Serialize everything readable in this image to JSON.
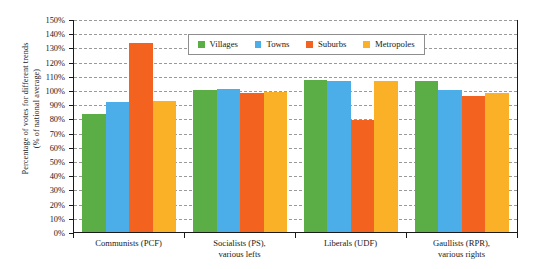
{
  "chart_data": {
    "type": "bar",
    "title": "",
    "xlabel": "",
    "ylabel_lines": [
      "Percentage of votes for different trends",
      "(% of national average)"
    ],
    "ylim": [
      0,
      150
    ],
    "ytick_step": 10,
    "ytick_labels": [
      "0%",
      "10%",
      "20%",
      "30%",
      "40%",
      "50%",
      "60%",
      "70%",
      "80%",
      "90%",
      "100%",
      "110%",
      "120%",
      "130%",
      "140%",
      "150%"
    ],
    "ytick_values": [
      0,
      10,
      20,
      30,
      40,
      50,
      60,
      70,
      80,
      90,
      100,
      110,
      120,
      130,
      140,
      150
    ],
    "grid": true,
    "grid_style": "dashed-horizontal",
    "legend_position": "top-center-inside",
    "categories": [
      {
        "lines": [
          "Communists (PCF)"
        ]
      },
      {
        "lines": [
          "Socialists (PS),",
          "various lefts"
        ]
      },
      {
        "lines": [
          "Liberals (UDF)"
        ]
      },
      {
        "lines": [
          "Gaullists (RPR),",
          "various rights"
        ]
      }
    ],
    "category_labels": [
      "Communists (PCF)",
      "Socialists (PS), various lefts",
      "Liberals (UDF)",
      "Gaullists (RPR), various rights"
    ],
    "series": [
      {
        "name": "Villages",
        "color": "#5BAD46",
        "values": [
          83,
          100,
          107,
          106
        ]
      },
      {
        "name": "Towns",
        "color": "#4BAEE8",
        "values": [
          91.5,
          101,
          106,
          100
        ]
      },
      {
        "name": "Suburbs",
        "color": "#F4621F",
        "values": [
          133,
          98,
          79,
          96
        ]
      },
      {
        "name": "Metropoles",
        "color": "#FAB127",
        "values": [
          92.5,
          98.5,
          106,
          98
        ]
      }
    ]
  },
  "legend": {
    "items": [
      {
        "label": "Villages",
        "color": "#5BAD46"
      },
      {
        "label": "Towns",
        "color": "#4BAEE8"
      },
      {
        "label": "Suburbs",
        "color": "#F4621F"
      },
      {
        "label": "Metropoles",
        "color": "#FAB127"
      }
    ]
  }
}
